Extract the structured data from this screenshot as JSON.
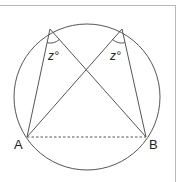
{
  "diagram": {
    "title": "",
    "colors": {
      "stroke": "#555555",
      "label": "#222222",
      "frame": "#b8b8b8"
    },
    "circle": {
      "cx": 87,
      "cy": 97,
      "r": 73
    },
    "points": {
      "A": {
        "label": "A",
        "x": 27,
        "y": 137
      },
      "B": {
        "label": "B",
        "x": 146,
        "y": 137
      },
      "P": {
        "label": "",
        "x": 50,
        "y": 29
      },
      "Q": {
        "label": "",
        "x": 122,
        "y": 29
      }
    },
    "segments": [
      {
        "from": "P",
        "to": "A",
        "style": "solid"
      },
      {
        "from": "P",
        "to": "B",
        "style": "solid"
      },
      {
        "from": "Q",
        "to": "A",
        "style": "solid"
      },
      {
        "from": "Q",
        "to": "B",
        "style": "solid"
      },
      {
        "from": "A",
        "to": "B",
        "style": "dashed"
      }
    ],
    "angles": [
      {
        "vertex": "P",
        "label": "z°",
        "label_text": "z",
        "degree_symbol": "°"
      },
      {
        "vertex": "Q",
        "label": "z°",
        "label_text": "z",
        "degree_symbol": "°"
      }
    ],
    "labels": {
      "A": "A",
      "B": "B",
      "angle_left": "z°",
      "angle_right": "z°"
    }
  }
}
